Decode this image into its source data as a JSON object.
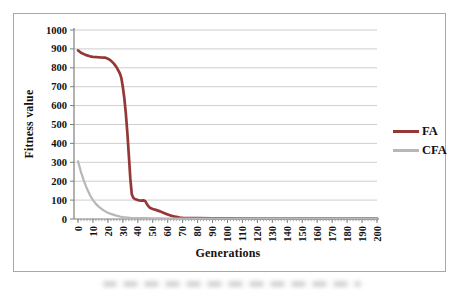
{
  "chart_data": {
    "type": "line",
    "title": "",
    "xlabel": "Generations",
    "ylabel": "Fitness value",
    "xlim": [
      0,
      200
    ],
    "ylim": [
      0,
      1000
    ],
    "xticks": [
      0,
      10,
      20,
      30,
      40,
      50,
      60,
      70,
      80,
      90,
      100,
      110,
      120,
      130,
      140,
      150,
      160,
      170,
      180,
      190,
      200
    ],
    "yticks": [
      0,
      100,
      200,
      300,
      400,
      500,
      600,
      700,
      800,
      900,
      1000
    ],
    "grid": "horizontal",
    "legend_position": "right",
    "x_tick_label_rotation": -90,
    "series": [
      {
        "name": "FA",
        "color": "#953735",
        "points": [
          [
            0,
            892
          ],
          [
            2,
            880
          ],
          [
            5,
            868
          ],
          [
            8,
            861
          ],
          [
            10,
            858
          ],
          [
            13,
            856
          ],
          [
            15,
            855
          ],
          [
            18,
            854
          ],
          [
            20,
            848
          ],
          [
            22,
            838
          ],
          [
            24,
            822
          ],
          [
            26,
            800
          ],
          [
            28,
            770
          ],
          [
            29,
            745
          ],
          [
            30,
            700
          ],
          [
            31,
            640
          ],
          [
            32,
            560
          ],
          [
            33,
            460
          ],
          [
            34,
            340
          ],
          [
            35,
            215
          ],
          [
            36,
            130
          ],
          [
            37,
            112
          ],
          [
            38,
            106
          ],
          [
            40,
            100
          ],
          [
            42,
            97
          ],
          [
            44,
            99
          ],
          [
            45,
            94
          ],
          [
            46,
            80
          ],
          [
            47,
            68
          ],
          [
            48,
            60
          ],
          [
            50,
            53
          ],
          [
            52,
            48
          ],
          [
            55,
            40
          ],
          [
            57,
            33
          ],
          [
            60,
            24
          ],
          [
            62,
            18
          ],
          [
            65,
            12
          ],
          [
            68,
            8
          ],
          [
            70,
            6
          ],
          [
            75,
            5
          ],
          [
            80,
            4
          ],
          [
            90,
            3
          ],
          [
            100,
            3
          ],
          [
            120,
            2
          ],
          [
            140,
            2
          ],
          [
            160,
            2
          ],
          [
            180,
            2
          ],
          [
            200,
            2
          ]
        ]
      },
      {
        "name": "CFA",
        "color": "#b7b7b7",
        "points": [
          [
            0,
            306
          ],
          [
            2,
            248
          ],
          [
            4,
            200
          ],
          [
            6,
            160
          ],
          [
            8,
            126
          ],
          [
            10,
            100
          ],
          [
            12,
            80
          ],
          [
            14,
            64
          ],
          [
            16,
            52
          ],
          [
            18,
            42
          ],
          [
            20,
            33
          ],
          [
            22,
            27
          ],
          [
            25,
            19
          ],
          [
            28,
            13
          ],
          [
            30,
            10
          ],
          [
            33,
            8
          ],
          [
            35,
            6
          ],
          [
            40,
            5
          ],
          [
            45,
            4
          ],
          [
            50,
            3
          ],
          [
            55,
            3
          ],
          [
            60,
            2
          ],
          [
            70,
            2
          ],
          [
            80,
            2
          ],
          [
            100,
            2
          ],
          [
            120,
            2
          ],
          [
            140,
            2
          ],
          [
            160,
            2
          ],
          [
            180,
            2
          ],
          [
            200,
            2
          ]
        ]
      }
    ],
    "colors": {
      "gridline": "#c8c8c8",
      "axis": "#7f7f7f",
      "tick_label": "#111111",
      "chart_border": "#a8a8a8"
    }
  }
}
